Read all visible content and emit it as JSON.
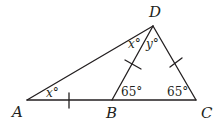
{
  "diagram": {
    "points": {
      "A": {
        "label": "A",
        "x": 27,
        "y": 100
      },
      "B": {
        "label": "B",
        "x": 112,
        "y": 100
      },
      "C": {
        "label": "C",
        "x": 196,
        "y": 100
      },
      "D": {
        "label": "D",
        "x": 153,
        "y": 26
      }
    },
    "angles": {
      "DAB": "x°",
      "ADB": "x°",
      "BDC": "y°",
      "DBC": "65°",
      "DCB": "65°"
    },
    "angle_parts": {
      "x_var": "x",
      "y_var": "y",
      "deg": "°",
      "b_val": "65°",
      "c_val": "65°"
    },
    "congruence_marks": [
      "AB",
      "BD",
      "DC"
    ],
    "stroke_color": "#231f20"
  }
}
